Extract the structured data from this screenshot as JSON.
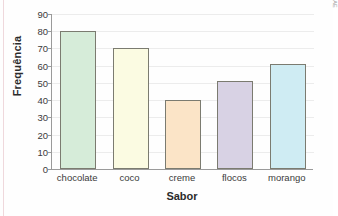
{
  "chart_data": {
    "type": "bar",
    "title": "",
    "categories": [
      "chocolate",
      "coco",
      "creme",
      "flocos",
      "morango"
    ],
    "values": [
      80,
      70,
      40,
      51,
      61
    ],
    "xlabel": "Sabor",
    "ylabel": "Frequência",
    "ylim": [
      0,
      90
    ],
    "ytick_labels": [
      "0",
      "10",
      "20",
      "30",
      "40",
      "50",
      "60",
      "70",
      "80",
      "90"
    ],
    "ytick_values": [
      0,
      10,
      20,
      30,
      40,
      50,
      60,
      70,
      80,
      90
    ],
    "grid": true,
    "legend": "none",
    "bar_colors": [
      "#d6ecd9",
      "#fbfbe2",
      "#fbe4c7",
      "#d8d2e4",
      "#cfecf3"
    ],
    "bar_border_color": "#7b7b70",
    "axis_color": "#9a9a9a",
    "gridline_color": "#ececec",
    "annotations": [
      {
        "name": "credit",
        "text": "Ilustrações: DAE"
      }
    ]
  },
  "figure": {
    "credit_text": "Ilustrações: DAE"
  }
}
